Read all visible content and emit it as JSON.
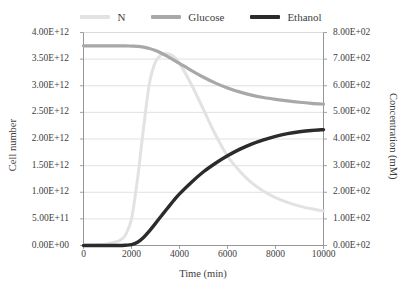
{
  "legend": {
    "position": "top-center",
    "entries": [
      {
        "label": "N",
        "color": "#e2e2e2"
      },
      {
        "label": "Glucose",
        "color": "#a8a8a8"
      },
      {
        "label": "Ethanol",
        "color": "#2b2b2b"
      }
    ]
  },
  "axes": {
    "x": {
      "title": "Time (min)",
      "ticks": [
        "0",
        "2000",
        "4000",
        "6000",
        "8000",
        "10000"
      ],
      "min": 0,
      "max": 10000
    },
    "y_left": {
      "title": "Cell number",
      "ticks": [
        "0.00E+00",
        "5.00E+11",
        "1.00E+12",
        "1.50E+12",
        "2.00E+12",
        "2.50E+12",
        "3.00E+12",
        "3.50E+12",
        "4.00E+12"
      ],
      "min": 0,
      "max": 4000000000000.0
    },
    "y_right": {
      "title": "Concentration (mM)",
      "ticks": [
        "0.00E+02",
        "1.00E+02",
        "2.00E+02",
        "3.00E+02",
        "4.00E+02",
        "5.00E+02",
        "6.00E+02",
        "7.00E+02",
        "8.00E+02"
      ],
      "min": 0,
      "max": 800
    }
  },
  "chart_data": {
    "type": "line",
    "title": "",
    "xlabel": "Time (min)",
    "ylabel": "Cell number",
    "ylabel_secondary": "Concentration (mM)",
    "xlim": [
      0,
      10000
    ],
    "ylim": [
      0,
      4000000000000.0
    ],
    "ylim_secondary": [
      0,
      800
    ],
    "grid": "horizontal",
    "legend_position": "top-center",
    "x": [
      0,
      500,
      1000,
      1500,
      1750,
      2000,
      2250,
      2500,
      2750,
      3000,
      3250,
      3500,
      3750,
      4000,
      4500,
      5000,
      5500,
      6000,
      6500,
      7000,
      7500,
      8000,
      8500,
      9000,
      9500,
      10000
    ],
    "series": [
      {
        "name": "N",
        "axis": "left",
        "units": "cells",
        "color": "#e2e2e2",
        "values": [
          10000000000.0,
          15000000000.0,
          30000000000.0,
          90000000000.0,
          200000000000.0,
          500000000000.0,
          1250000000000.0,
          2200000000000.0,
          3050000000000.0,
          3450000000000.0,
          3580000000000.0,
          3600000000000.0,
          3550000000000.0,
          3420000000000.0,
          3020000000000.0,
          2550000000000.0,
          2080000000000.0,
          1680000000000.0,
          1400000000000.0,
          1180000000000.0,
          1020000000000.0,
          900000000000.0,
          810000000000.0,
          740000000000.0,
          690000000000.0,
          650000000000.0
        ]
      },
      {
        "name": "Glucose",
        "axis": "right",
        "units": "mM",
        "color": "#a8a8a8",
        "values": [
          750,
          750,
          750,
          750,
          750,
          749,
          748,
          745,
          740,
          732,
          722,
          710,
          697,
          684,
          657,
          632,
          610,
          592,
          577,
          565,
          556,
          549,
          543,
          538,
          534,
          531
        ]
      },
      {
        "name": "Ethanol",
        "axis": "right",
        "units": "mM",
        "color": "#2b2b2b",
        "values": [
          0,
          0,
          0,
          0,
          1,
          3,
          12,
          30,
          55,
          83,
          112,
          140,
          168,
          194,
          238,
          277,
          309,
          337,
          361,
          381,
          397,
          410,
          420,
          427,
          432,
          435
        ]
      }
    ]
  }
}
